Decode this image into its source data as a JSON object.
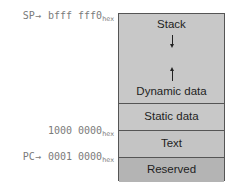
{
  "diagram": {
    "segments": [
      {
        "id": "stack",
        "label": "Stack",
        "fill": "#c8c8c8"
      },
      {
        "id": "dynamic",
        "label": "Dynamic data",
        "fill": "#c8c8c8"
      },
      {
        "id": "static",
        "label": "Static data",
        "fill": "#c8c8c8"
      },
      {
        "id": "text",
        "label": "Text",
        "fill": "#c4c4c4"
      },
      {
        "id": "reserved",
        "label": "Reserved",
        "fill": "#b4b4b4"
      }
    ],
    "addresses": {
      "sp": {
        "pointer": "SP",
        "arrow": "→",
        "value": "bfff fff0",
        "suffix": "hex"
      },
      "static_start": {
        "value": "1000 0000",
        "suffix": "hex"
      },
      "pc": {
        "pointer": "PC",
        "arrow": "→",
        "value": "0001 0000",
        "suffix": "hex"
      }
    },
    "arrows": {
      "stack_growth": "down",
      "heap_growth": "up"
    }
  }
}
